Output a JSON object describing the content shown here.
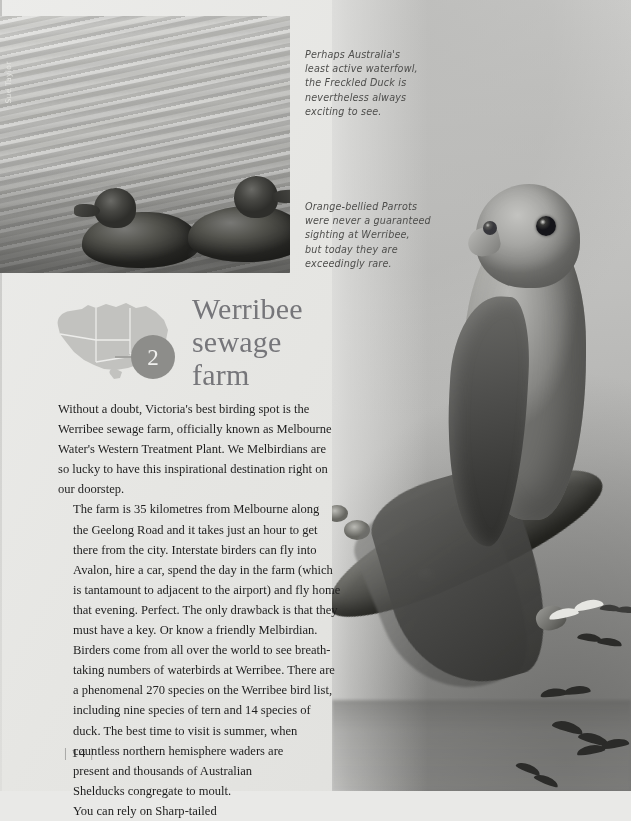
{
  "page": {
    "folio_number": "14",
    "background_color": "#e9e9e7"
  },
  "credit": {
    "photographer": "Sue Taylor"
  },
  "photos": {
    "duck": {
      "name": "freckled-duck-on-water",
      "subject": "Freckled Duck swimming"
    },
    "parrot": {
      "name": "orange-bellied-parrot-on-branch",
      "subject": "Orange-bellied Parrot perched on a lichen covered branch"
    }
  },
  "captions": {
    "duck": [
      "Perhaps Australia's",
      "least active waterfowl,",
      "the Freckled Duck is",
      "nevertheless always",
      "exciting to see."
    ],
    "parrot": [
      "Orange-bellied Parrots",
      "were never a guaranteed",
      "sighting at Werribee,",
      "but today they are",
      "exceedingly rare."
    ]
  },
  "headline": {
    "lines": [
      "Werribee",
      "sewage",
      "farm"
    ],
    "color": "#76767a",
    "marker_number": "2",
    "marker_color": "#8d8d8a",
    "map_label": "map-of-australia"
  },
  "body": {
    "paragraphs": [
      [
        "Without a doubt, Victoria's best birding spot is the",
        "Werribee sewage farm, officially known as Melbourne",
        "Water's Western Treatment Plant. We Melbirdians are",
        "so lucky to have this inspirational destination right on",
        "our doorstep."
      ],
      [
        "The farm is 35 kilometres from Melbourne along",
        "the Geelong Road and it takes just an hour to get",
        "there from the city. Interstate birders can fly into",
        "Avalon, hire a car, spend the day in the farm (which",
        "is tantamount to adjacent to the airport) and fly home",
        "that evening. Perfect. The only drawback is that they",
        "must have a key. Or know a friendly Melbirdian."
      ],
      [
        "Birders come from all over the world to see breath-",
        "taking numbers of waterbirds at Werribee. There are",
        "a phenomenal 270 species on the Werribee bird list,",
        "including nine species of tern and 14 species of",
        "duck. The best time to visit is summer, when",
        "countless northern hemisphere waders are",
        "present and thousands of Australian",
        "Shelducks congregate to moult.",
        "You can rely on Sharp-tailed"
      ]
    ]
  }
}
